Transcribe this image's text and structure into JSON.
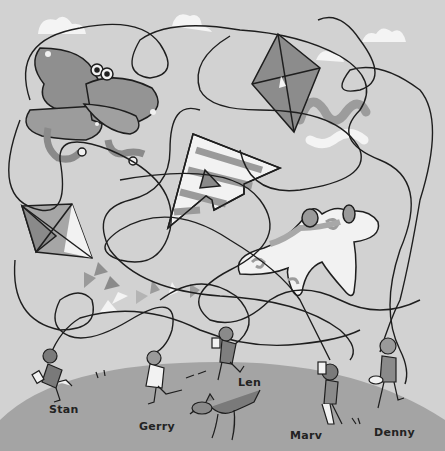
{
  "puzzle": {
    "type": "kite string maze",
    "colors": {
      "sky": "#d2d2d2",
      "hill": "#a4a4a4",
      "cloud": "#f4f4f4",
      "string": "#1e1e1e",
      "kite_dark": "#8a8a8a",
      "kite_mid": "#a9a9a9",
      "kite_light": "#f2f2f2"
    },
    "kites": [
      {
        "id": "butterfly",
        "label": "butterfly kite with snake tails"
      },
      {
        "id": "diamond-top-right",
        "label": "diamond kite"
      },
      {
        "id": "striped-arrow",
        "label": "striped arrow kite"
      },
      {
        "id": "diamond-left",
        "label": "diamond kite with bow tail"
      },
      {
        "id": "swirl-plane",
        "label": "swirl-patterned plane kite"
      }
    ],
    "children": [
      {
        "name": "Stan"
      },
      {
        "name": "Gerry"
      },
      {
        "name": "Len"
      },
      {
        "name": "Marv"
      },
      {
        "name": "Denny"
      }
    ]
  }
}
